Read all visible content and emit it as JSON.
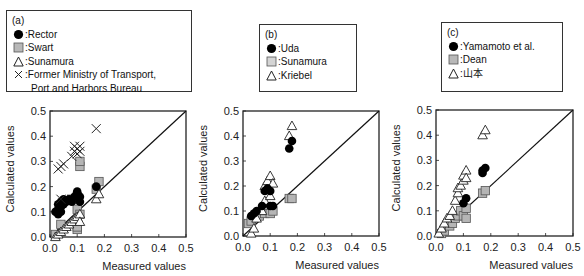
{
  "figure": {
    "panels": [
      {
        "tag": "(a)",
        "legend": [
          {
            "marker": "filled-circle",
            "label": "Rector"
          },
          {
            "marker": "gray-square",
            "label": "Swart"
          },
          {
            "marker": "open-triangle",
            "label": "Sunamura"
          },
          {
            "marker": "cross",
            "label": "Former Ministry of Transport,",
            "label2": "Port and Harbors Bureau"
          }
        ]
      },
      {
        "tag": "(b)",
        "legend": [
          {
            "marker": "filled-circle",
            "label": "Uda"
          },
          {
            "marker": "gray-square",
            "label": "Sunamura"
          },
          {
            "marker": "open-triangle",
            "label": "Kriebel"
          }
        ]
      },
      {
        "tag": "(c)",
        "legend": [
          {
            "marker": "filled-circle",
            "label": "Yamamoto et al."
          },
          {
            "marker": "gray-square",
            "label": "Dean"
          },
          {
            "marker": "open-triangle",
            "label": "山本"
          }
        ]
      }
    ],
    "separator": ":"
  },
  "chart_data": [
    {
      "type": "scatter",
      "title": "(a)",
      "xlabel": "Measured values",
      "ylabel": "Calculated values",
      "xlim": [
        0,
        0.5
      ],
      "ylim": [
        0,
        0.5
      ],
      "xticks": [
        "0.0",
        "0.1",
        "0.2",
        "0.3",
        "0.4",
        "0.5"
      ],
      "yticks": [
        "0.0",
        "0.1",
        "0.2",
        "0.3",
        "0.4",
        "0.5"
      ],
      "reference_line": "y = x",
      "grid": false,
      "legend_position": "top (above plot)",
      "series": [
        {
          "name": "Rector",
          "marker": "filled-circle",
          "points": [
            [
              0.02,
              0.1
            ],
            [
              0.03,
              0.11
            ],
            [
              0.03,
              0.13
            ],
            [
              0.04,
              0.12
            ],
            [
              0.04,
              0.14
            ],
            [
              0.05,
              0.13
            ],
            [
              0.05,
              0.15
            ],
            [
              0.06,
              0.14
            ],
            [
              0.07,
              0.15
            ],
            [
              0.08,
              0.14
            ],
            [
              0.09,
              0.16
            ],
            [
              0.1,
              0.17
            ],
            [
              0.1,
              0.18
            ],
            [
              0.11,
              0.16
            ],
            [
              0.11,
              0.14
            ],
            [
              0.17,
              0.2
            ],
            [
              0.04,
              0.1
            ],
            [
              0.03,
              0.09
            ]
          ]
        },
        {
          "name": "Swart",
          "marker": "gray-square",
          "points": [
            [
              0.02,
              0.01
            ],
            [
              0.04,
              0.05
            ],
            [
              0.08,
              0.15
            ],
            [
              0.1,
              0.03
            ],
            [
              0.1,
              0.11
            ],
            [
              0.1,
              0.16
            ],
            [
              0.11,
              0.09
            ],
            [
              0.11,
              0.28
            ],
            [
              0.11,
              0.3
            ],
            [
              0.17,
              0.19
            ],
            [
              0.18,
              0.22
            ],
            [
              0.1,
              0.04
            ]
          ]
        },
        {
          "name": "Sunamura",
          "marker": "open-triangle",
          "points": [
            [
              0.02,
              0.0
            ],
            [
              0.03,
              0.01
            ],
            [
              0.04,
              0.02
            ],
            [
              0.05,
              0.03
            ],
            [
              0.06,
              0.04
            ],
            [
              0.07,
              0.05
            ],
            [
              0.08,
              0.06
            ],
            [
              0.09,
              0.07
            ],
            [
              0.1,
              0.08
            ],
            [
              0.11,
              0.09
            ],
            [
              0.11,
              0.06
            ],
            [
              0.17,
              0.15
            ],
            [
              0.18,
              0.17
            ]
          ]
        },
        {
          "name": "Former Ministry of Transport, Port and Harbors Bureau",
          "marker": "cross",
          "points": [
            [
              0.03,
              0.27
            ],
            [
              0.04,
              0.28
            ],
            [
              0.05,
              0.29
            ],
            [
              0.04,
              0.15
            ],
            [
              0.08,
              0.32
            ],
            [
              0.09,
              0.34
            ],
            [
              0.09,
              0.36
            ],
            [
              0.1,
              0.35
            ],
            [
              0.1,
              0.33
            ],
            [
              0.11,
              0.36
            ],
            [
              0.11,
              0.34
            ],
            [
              0.17,
              0.43
            ]
          ]
        }
      ]
    },
    {
      "type": "scatter",
      "title": "(b)",
      "xlabel": "Measured values",
      "ylabel": "Calculated values",
      "xlim": [
        0,
        0.5
      ],
      "ylim": [
        0,
        0.5
      ],
      "xticks": [
        "0.0",
        "0.1",
        "0.2",
        "0.3",
        "0.4",
        "0.5"
      ],
      "yticks": [
        "0.0",
        "0.1",
        "0.2",
        "0.3",
        "0.4",
        "0.5"
      ],
      "reference_line": "y = x",
      "grid": false,
      "legend_position": "top (above plot)",
      "series": [
        {
          "name": "Uda",
          "marker": "filled-circle",
          "points": [
            [
              0.03,
              0.08
            ],
            [
              0.04,
              0.09
            ],
            [
              0.05,
              0.1
            ],
            [
              0.07,
              0.12
            ],
            [
              0.08,
              0.18
            ],
            [
              0.09,
              0.19
            ],
            [
              0.1,
              0.18
            ],
            [
              0.1,
              0.12
            ],
            [
              0.11,
              0.12
            ],
            [
              0.17,
              0.35
            ],
            [
              0.18,
              0.38
            ]
          ]
        },
        {
          "name": "Sunamura",
          "marker": "gray-square",
          "points": [
            [
              0.02,
              0.05
            ],
            [
              0.03,
              0.06
            ],
            [
              0.06,
              0.08
            ],
            [
              0.08,
              0.09
            ],
            [
              0.1,
              0.09
            ],
            [
              0.11,
              0.1
            ],
            [
              0.17,
              0.15
            ],
            [
              0.18,
              0.15
            ]
          ]
        },
        {
          "name": "Kriebel",
          "marker": "open-triangle",
          "points": [
            [
              0.03,
              0.01
            ],
            [
              0.04,
              0.03
            ],
            [
              0.05,
              0.07
            ],
            [
              0.07,
              0.1
            ],
            [
              0.08,
              0.14
            ],
            [
              0.08,
              0.2
            ],
            [
              0.09,
              0.22
            ],
            [
              0.1,
              0.24
            ],
            [
              0.1,
              0.16
            ],
            [
              0.11,
              0.21
            ],
            [
              0.17,
              0.4
            ],
            [
              0.18,
              0.44
            ]
          ]
        }
      ]
    },
    {
      "type": "scatter",
      "title": "(c)",
      "xlabel": "Measured values",
      "ylabel": "Calculated values",
      "xlim": [
        0,
        0.5
      ],
      "ylim": [
        0,
        0.5
      ],
      "xticks": [
        "0.0",
        "0.1",
        "0.2",
        "0.3",
        "0.4",
        "0.5"
      ],
      "yticks": [
        "0.0",
        "0.1",
        "0.2",
        "0.3",
        "0.4",
        "0.5"
      ],
      "reference_line": "y = x",
      "grid": false,
      "legend_position": "top (above plot)",
      "series": [
        {
          "name": "Yamamoto et al.",
          "marker": "filled-circle",
          "points": [
            [
              0.1,
              0.13
            ],
            [
              0.11,
              0.15
            ],
            [
              0.17,
              0.25
            ],
            [
              0.18,
              0.27
            ],
            [
              0.17,
              0.26
            ]
          ]
        },
        {
          "name": "Dean",
          "marker": "gray-square",
          "points": [
            [
              0.02,
              0.01
            ],
            [
              0.03,
              0.02
            ],
            [
              0.05,
              0.04
            ],
            [
              0.06,
              0.05
            ],
            [
              0.07,
              0.07
            ],
            [
              0.08,
              0.08
            ],
            [
              0.09,
              0.1
            ],
            [
              0.1,
              0.08
            ],
            [
              0.11,
              0.11
            ],
            [
              0.11,
              0.07
            ],
            [
              0.17,
              0.17
            ],
            [
              0.18,
              0.18
            ]
          ]
        },
        {
          "name": "山本",
          "marker": "open-triangle",
          "points": [
            [
              0.01,
              0.01
            ],
            [
              0.02,
              0.03
            ],
            [
              0.03,
              0.05
            ],
            [
              0.04,
              0.07
            ],
            [
              0.05,
              0.08
            ],
            [
              0.06,
              0.1
            ],
            [
              0.07,
              0.14
            ],
            [
              0.08,
              0.17
            ],
            [
              0.08,
              0.19
            ],
            [
              0.09,
              0.2
            ],
            [
              0.1,
              0.22
            ],
            [
              0.1,
              0.24
            ],
            [
              0.11,
              0.26
            ],
            [
              0.11,
              0.23
            ],
            [
              0.17,
              0.4
            ],
            [
              0.18,
              0.42
            ]
          ]
        }
      ]
    }
  ]
}
